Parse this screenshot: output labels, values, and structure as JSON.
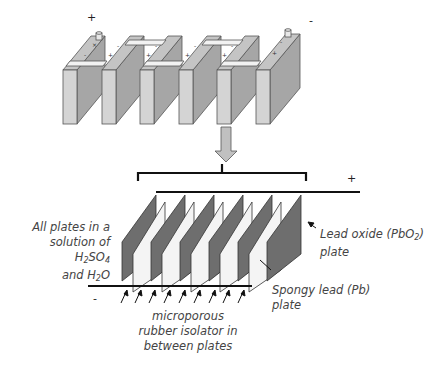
{
  "diagram": {
    "top_battery": {
      "positive_terminal_label": "+",
      "negative_terminal_label": "-",
      "cell_count": 6
    },
    "cell_detail": {
      "positive_bus_label": "+",
      "negative_bus_label": "-",
      "plate_pairs": 5
    },
    "labels": {
      "solution_line1": "All plates in a",
      "solution_line2_prefix": "solution of H",
      "solution_line2_sub1": "2",
      "solution_line2_mid": "SO",
      "solution_line2_sub2": "4",
      "solution_line3_prefix": "and H",
      "solution_line3_sub": "2",
      "solution_line3_suffix": "O",
      "lead_oxide_line1_prefix": "Lead oxide (PbO",
      "lead_oxide_line1_sub": "2",
      "lead_oxide_line1_suffix": ")",
      "lead_oxide_line2": "plate",
      "spongy_line1": "Spongy lead (Pb)",
      "spongy_line2": "plate",
      "isolator_line1": "microporous",
      "isolator_line2": "rubber isolator in",
      "isolator_line3": "between plates"
    },
    "colors": {
      "cell_front": "#d4d4d4",
      "cell_side": "#a6a6a6",
      "cell_top": "#c4c4c4",
      "lead_oxide_plate": "#6e6e6e",
      "spongy_plate": "#f4f4f4",
      "line": "#111111",
      "text": "#444444"
    }
  }
}
